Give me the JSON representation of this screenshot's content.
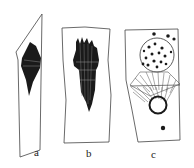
{
  "figure": {
    "panels": [
      {
        "id": "a",
        "label": "a",
        "description": "elongated slanted cell outline with dark spindle-shaped body"
      },
      {
        "id": "b",
        "label": "b",
        "description": "rectangular cell with dense fibrous bundle"
      },
      {
        "id": "c",
        "label": "c",
        "description": "cell with dotted nucleus, striated spindle and small dark granule"
      }
    ],
    "colors": {
      "stroke": "#333333",
      "fill": "#1a1a1a",
      "background": "#ffffff"
    }
  }
}
